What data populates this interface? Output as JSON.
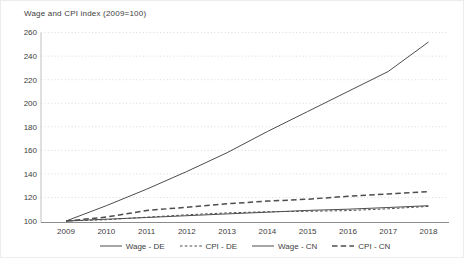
{
  "chart": {
    "title": "Wage and CPI index (2009=100)"
  },
  "colors": {
    "background": "#ffffff",
    "line": "#4d4d4d",
    "grid": "#d9d9d9",
    "x_axis": "#8c8c8c",
    "y_axis": "#bfbfbf",
    "text": "#404040"
  },
  "chart_data": {
    "type": "line",
    "title": "Wage and CPI index (2009=100)",
    "x": [
      2009,
      2010,
      2011,
      2012,
      2013,
      2014,
      2015,
      2016,
      2017,
      2018
    ],
    "series": [
      {
        "name": "Wage - DE",
        "style": "solid",
        "width": 1,
        "values": [
          100,
          101.5,
          103,
          104.5,
          106,
          107.5,
          109,
          110,
          111.5,
          113
        ]
      },
      {
        "name": "CPI - DE",
        "style": "dash-small",
        "width": 1,
        "values": [
          100,
          101.1,
          103.2,
          105.3,
          106.9,
          107.9,
          108.2,
          108.8,
          110.4,
          112.4
        ]
      },
      {
        "name": "Wage - CN",
        "style": "solid",
        "width": 1,
        "values": [
          100,
          113,
          127,
          142,
          158,
          176,
          193,
          210,
          227,
          252
        ]
      },
      {
        "name": "CPI - CN",
        "style": "dash-long",
        "width": 1.5,
        "values": [
          100,
          103.3,
          108.9,
          111.7,
          114.6,
          116.9,
          118.5,
          121,
          123,
          125
        ]
      }
    ],
    "ylim": [
      100,
      260
    ],
    "yticks": [
      100,
      120,
      140,
      160,
      180,
      200,
      220,
      240,
      260
    ],
    "grid": "horizontal-dotted",
    "legend_position": "bottom",
    "legend_labels": [
      "Wage - DE",
      "CPI - DE",
      "Wage - CN",
      "CPI - CN"
    ]
  }
}
